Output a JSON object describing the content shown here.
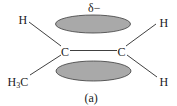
{
  "diagram": {
    "caption": "(a)",
    "charge_label": "δ−",
    "fill_color": "#a9a9a9",
    "outline_color": "#3a3a3a",
    "atoms": {
      "carbon_left": "C",
      "carbon_right": "C",
      "h_top_left": "H",
      "h_top_right": "H",
      "h_bottom_right": "H",
      "methyl_left_main": "H",
      "methyl_left_sub": "3",
      "methyl_left_tail": "C"
    },
    "lobes": [
      {
        "name": "pi-lobe-top",
        "cx": 93,
        "cy": 24,
        "rx": 37.5,
        "ry": 9
      },
      {
        "name": "pi-lobe-bottom",
        "cx": 93.5,
        "cy": 71,
        "rx": 37.5,
        "ry": 10
      }
    ]
  }
}
